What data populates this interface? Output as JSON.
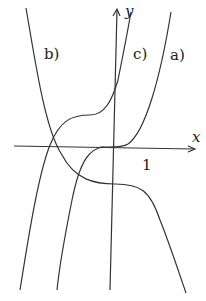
{
  "diagram": {
    "axes": {
      "x_label": "x",
      "y_label": "y",
      "tick_label": "1"
    },
    "curves": [
      {
        "id": "a",
        "label": "a)"
      },
      {
        "id": "b",
        "label": "b)"
      },
      {
        "id": "c",
        "label": "c)"
      }
    ],
    "colors": {
      "stroke": "#333333",
      "background": "#ffffff"
    }
  }
}
